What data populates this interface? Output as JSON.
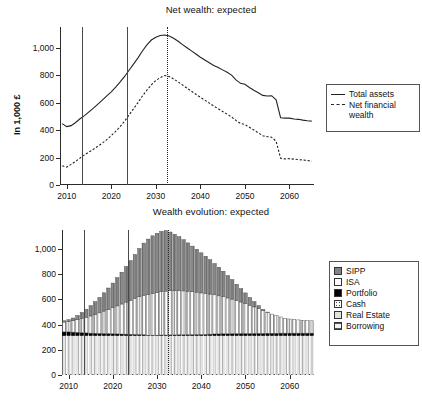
{
  "figure": {
    "ylabel": "In 1,000 £"
  },
  "panels": [
    {
      "id": "net-wealth",
      "title": "Net wealth: expected"
    },
    {
      "id": "wealth-evolution",
      "title": "Wealth evolution: expected"
    }
  ],
  "axes": {
    "yticks": [
      "0",
      "200",
      "400",
      "600",
      "800",
      "1,000"
    ],
    "ytick_values": [
      0,
      200,
      400,
      600,
      800,
      1000
    ],
    "xticks": [
      "2010",
      "2020",
      "2030",
      "2040",
      "2050",
      "2060"
    ],
    "xtick_values": [
      2010,
      2020,
      2030,
      2040,
      2050,
      2060
    ],
    "ylim": [
      0,
      1150
    ],
    "xlim": [
      2008.5,
      2065.5
    ]
  },
  "legend_top": {
    "items": [
      {
        "label": "Total assets",
        "style": "solid"
      },
      {
        "label": "Net financial wealth",
        "style": "dashed"
      }
    ]
  },
  "legend_bottom": {
    "items": [
      {
        "label": "SIPP",
        "swatch": "sw-sipp",
        "color": "#838383"
      },
      {
        "label": "ISA",
        "swatch": "sw-isa",
        "color": "#ffffff"
      },
      {
        "label": "Portfolio",
        "swatch": "sw-portfolio",
        "color": "#000000"
      },
      {
        "label": "Cash",
        "swatch": "sw-cash",
        "color": "#ffffff"
      },
      {
        "label": "Real Estate",
        "swatch": "sw-realestate",
        "color": "#e2e2e2"
      },
      {
        "label": "Borrowing",
        "swatch": "sw-borrowing",
        "color": "#f2f2f2"
      }
    ]
  },
  "markers": {
    "vlines_solid": [
      2013.5,
      2023.5
    ],
    "vlines_dotted": [
      2032.5
    ]
  },
  "chart_data": [
    {
      "type": "line",
      "title": "Net wealth: expected",
      "xlabel": "",
      "ylabel": "In 1,000 £",
      "ylim": [
        0,
        1150
      ],
      "xlim": [
        2008.5,
        2065.5
      ],
      "grid": false,
      "legend_position": "right",
      "x": [
        2009,
        2010,
        2011,
        2012,
        2013,
        2014,
        2015,
        2016,
        2017,
        2018,
        2019,
        2020,
        2021,
        2022,
        2023,
        2024,
        2025,
        2026,
        2027,
        2028,
        2029,
        2030,
        2031,
        2032,
        2033,
        2034,
        2035,
        2036,
        2037,
        2038,
        2039,
        2040,
        2041,
        2042,
        2043,
        2044,
        2045,
        2046,
        2047,
        2048,
        2049,
        2050,
        2051,
        2052,
        2053,
        2054,
        2055,
        2056,
        2057,
        2058,
        2059,
        2060,
        2061,
        2062,
        2063,
        2064,
        2065
      ],
      "series": [
        {
          "name": "Total assets",
          "style": "solid",
          "values": [
            447,
            425,
            432,
            455,
            482,
            505,
            532,
            560,
            588,
            618,
            648,
            678,
            712,
            750,
            790,
            835,
            880,
            925,
            975,
            1020,
            1055,
            1075,
            1088,
            1092,
            1085,
            1068,
            1046,
            1022,
            999,
            976,
            953,
            930,
            910,
            890,
            870,
            855,
            838,
            820,
            800,
            765,
            740,
            733,
            710,
            690,
            672,
            652,
            648,
            650,
            620,
            490,
            487,
            487,
            480,
            478,
            472,
            468,
            465
          ]
        },
        {
          "name": "Net financial wealth",
          "style": "dashed",
          "values": [
            140,
            130,
            150,
            172,
            196,
            220,
            240,
            260,
            282,
            305,
            330,
            360,
            390,
            425,
            465,
            510,
            555,
            600,
            648,
            690,
            728,
            760,
            782,
            797,
            790,
            772,
            750,
            728,
            705,
            682,
            660,
            638,
            618,
            596,
            575,
            555,
            535,
            515,
            495,
            470,
            448,
            440,
            420,
            400,
            380,
            358,
            352,
            348,
            318,
            195,
            190,
            192,
            188,
            185,
            182,
            178,
            173
          ]
        }
      ]
    },
    {
      "type": "bar",
      "subtype": "stacked",
      "title": "Wealth evolution: expected",
      "xlabel": "",
      "ylabel": "In 1,000 £",
      "ylim": [
        0,
        1150
      ],
      "xlim": [
        2008.5,
        2065.5
      ],
      "grid": false,
      "legend_position": "right",
      "categories": [
        2009,
        2010,
        2011,
        2012,
        2013,
        2014,
        2015,
        2016,
        2017,
        2018,
        2019,
        2020,
        2021,
        2022,
        2023,
        2024,
        2025,
        2026,
        2027,
        2028,
        2029,
        2030,
        2031,
        2032,
        2033,
        2034,
        2035,
        2036,
        2037,
        2038,
        2039,
        2040,
        2041,
        2042,
        2043,
        2044,
        2045,
        2046,
        2047,
        2048,
        2049,
        2050,
        2051,
        2052,
        2053,
        2054,
        2055,
        2056,
        2057,
        2058,
        2059,
        2060,
        2061,
        2062,
        2063,
        2064,
        2065
      ],
      "series": [
        {
          "name": "Real Estate",
          "values": [
            312,
            312,
            312,
            312,
            312,
            312,
            312,
            312,
            312,
            312,
            312,
            312,
            312,
            312,
            312,
            312,
            312,
            312,
            312,
            312,
            312,
            312,
            312,
            312,
            312,
            312,
            312,
            312,
            312,
            312,
            312,
            312,
            312,
            312,
            312,
            312,
            312,
            312,
            312,
            312,
            312,
            312,
            312,
            312,
            312,
            312,
            312,
            312,
            312,
            312,
            312,
            312,
            312,
            312,
            312,
            312,
            312
          ]
        },
        {
          "name": "Portfolio",
          "values": [
            30,
            30,
            28,
            26,
            24,
            22,
            20,
            19,
            18,
            17,
            16,
            15,
            14,
            13,
            12,
            11,
            10,
            9,
            8,
            4,
            4,
            4,
            5,
            5,
            6,
            6,
            7,
            7,
            8,
            8,
            9,
            9,
            10,
            12,
            14,
            14,
            15,
            15,
            16,
            16,
            17,
            17,
            17,
            18,
            18,
            18,
            19,
            19,
            19,
            20,
            20,
            20,
            20,
            20,
            20,
            20,
            20
          ]
        },
        {
          "name": "ISA",
          "values": [
            78,
            82,
            90,
            100,
            112,
            124,
            136,
            150,
            163,
            178,
            192,
            206,
            222,
            238,
            254,
            270,
            286,
            300,
            312,
            322,
            330,
            338,
            344,
            348,
            350,
            350,
            350,
            348,
            344,
            340,
            336,
            330,
            324,
            318,
            310,
            302,
            294,
            284,
            274,
            262,
            250,
            238,
            224,
            210,
            196,
            180,
            166,
            152,
            140,
            128,
            118,
            112,
            108,
            105,
            102,
            100,
            98
          ]
        },
        {
          "name": "SIPP",
          "values": [
            10,
            14,
            22,
            34,
            48,
            64,
            82,
            100,
            122,
            145,
            170,
            196,
            224,
            252,
            282,
            314,
            348,
            382,
            414,
            440,
            458,
            470,
            478,
            480,
            466,
            448,
            428,
            406,
            384,
            362,
            340,
            318,
            296,
            272,
            248,
            226,
            202,
            178,
            154,
            130,
            106,
            84,
            62,
            42,
            24,
            10,
            2,
            0,
            0,
            0,
            0,
            0,
            0,
            0,
            0,
            0,
            0
          ]
        }
      ],
      "series_order_bottom_to_top": [
        "Real Estate",
        "Portfolio",
        "ISA",
        "SIPP"
      ]
    }
  ]
}
